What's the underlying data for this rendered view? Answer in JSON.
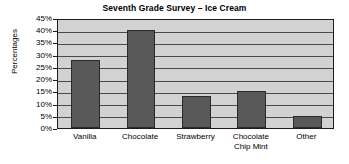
{
  "chart_data": {
    "type": "bar",
    "title": "Seventh Grade Survey – Ice Cream",
    "xlabel": "",
    "ylabel": "Percentages",
    "categories": [
      "Vanilla",
      "Chocolate",
      "Strawberry",
      "Chocolate\nChip Mint",
      "Other"
    ],
    "values": [
      28,
      40,
      13,
      15,
      5
    ],
    "value_labels": [
      "28%",
      "40%",
      "13%",
      "15%",
      "5%"
    ],
    "ylim": [
      0,
      45
    ],
    "ytick_values": [
      45,
      40,
      35,
      30,
      25,
      20,
      15,
      10,
      5,
      0
    ],
    "ytick_labels": [
      "45%",
      "40%",
      "35%",
      "30%",
      "25%",
      "20%",
      "15%",
      "10%",
      "5%",
      "0%"
    ],
    "grid": true,
    "legend": false,
    "colors": {
      "bar_fill": "#595959",
      "bar_edge": "#2a2a2a",
      "plot_background": "#d2d2d2",
      "axis": "#1d1d1d",
      "gridline": "#4a4a4a",
      "figure_background": "#ffffff",
      "text": "#000000"
    }
  }
}
